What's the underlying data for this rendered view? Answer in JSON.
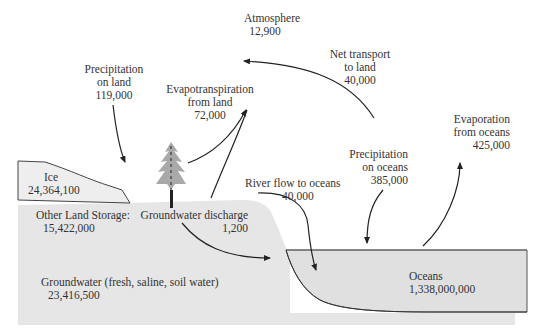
{
  "diagram": {
    "colors": {
      "land": "#e6e6e6",
      "ocean": "#e2e2e2",
      "ice": "#ededed",
      "tree": "#a9a9a9",
      "line": "#222222",
      "text": "#333333"
    },
    "reservoirs": {
      "atmosphere": {
        "name": "Atmosphere",
        "value": "12,900"
      },
      "ice": {
        "name": "Ice",
        "value": "24,364,100"
      },
      "other_land": {
        "name": "Other Land Storage:",
        "value": "15,422,000"
      },
      "groundwater": {
        "name": "Groundwater (fresh, saline, soil water)",
        "value": "23,416,500"
      },
      "oceans": {
        "name": "Oceans",
        "value": "1,338,000,000"
      }
    },
    "fluxes": {
      "precip_land": {
        "line1": "Precipitation",
        "line2": "on land",
        "value": "119,000"
      },
      "evapotranspiration": {
        "line1": "Evapotranspiration",
        "line2": "from land",
        "value": "72,000"
      },
      "net_transport": {
        "line1": "Net transport",
        "line2": "to land",
        "value": "40,000"
      },
      "evap_oceans": {
        "line1": "Evaporation",
        "line2": "from oceans",
        "value": "425,000"
      },
      "precip_oceans": {
        "line1": "Precipitation",
        "line2": "on oceans",
        "value": "385,000"
      },
      "river_flow": {
        "line1": "River flow to oceans",
        "value": "40,000"
      },
      "groundwater_discharge": {
        "line1": "Groundwater discharge",
        "value": "1,200"
      }
    }
  }
}
